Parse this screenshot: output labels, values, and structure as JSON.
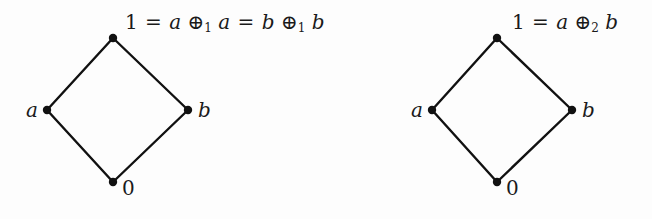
{
  "figure": {
    "type": "hasse-diagram-pair",
    "background_color": "#fdfdfd",
    "stroke_color": "#111111",
    "diagrams": [
      {
        "id": "left-lattice",
        "top_label": {
          "parts": [
            "1",
            "=",
            "a",
            "⊕",
            "1",
            "a",
            "=",
            "b",
            "⊕",
            "1",
            "b"
          ],
          "text": "1 = a ⊕1 a = b ⊕1 b"
        },
        "nodes": [
          {
            "name": "top",
            "label": "",
            "x": 113,
            "y": 38
          },
          {
            "name": "left",
            "label": "a",
            "x": 47,
            "y": 110
          },
          {
            "name": "right",
            "label": "b",
            "x": 188,
            "y": 110
          },
          {
            "name": "bottom",
            "label": "0",
            "x": 113,
            "y": 182
          }
        ],
        "edges": [
          {
            "from": "left",
            "to": "top"
          },
          {
            "from": "top",
            "to": "right"
          },
          {
            "from": "left",
            "to": "bottom"
          },
          {
            "from": "bottom",
            "to": "right"
          }
        ]
      },
      {
        "id": "right-lattice",
        "top_label": {
          "parts": [
            "1",
            "=",
            "a",
            "⊕",
            "2",
            "b"
          ],
          "text": "1 = a ⊕2 b"
        },
        "nodes": [
          {
            "name": "top",
            "label": "",
            "x": 497,
            "y": 38
          },
          {
            "name": "left",
            "label": "a",
            "x": 432,
            "y": 110
          },
          {
            "name": "right",
            "label": "b",
            "x": 572,
            "y": 110
          },
          {
            "name": "bottom",
            "label": "0",
            "x": 497,
            "y": 182
          }
        ],
        "edges": [
          {
            "from": "left",
            "to": "top"
          },
          {
            "from": "top",
            "to": "right"
          },
          {
            "from": "left",
            "to": "bottom"
          },
          {
            "from": "bottom",
            "to": "right"
          }
        ]
      }
    ]
  },
  "labels": {
    "left": {
      "one": "1",
      "eq1": "=",
      "a1": "a",
      "oplus1": "⊕",
      "sub1": "1",
      "a2": "a",
      "eq2": "=",
      "b1": "b",
      "oplus2": "⊕",
      "sub2": "1",
      "b2": "b",
      "node_a": "a",
      "node_b": "b",
      "node_zero": "0"
    },
    "right": {
      "one": "1",
      "eq1": "=",
      "a1": "a",
      "oplus1": "⊕",
      "sub1": "2",
      "b1": "b",
      "node_a": "a",
      "node_b": "b",
      "node_zero": "0"
    }
  }
}
